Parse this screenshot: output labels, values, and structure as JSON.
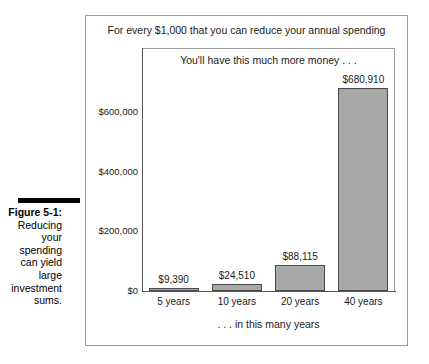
{
  "caption": {
    "figure_label": "Figure 5-1:",
    "text": "Reducing your spending can yield large investment sums."
  },
  "chart_data": {
    "type": "bar",
    "title": "For every $1,000 that you can reduce your annual spending",
    "subtitle": "You'll have this much more money . . .",
    "xlabel": ". . . in this many years",
    "ylabel": "",
    "categories": [
      "5 years",
      "10 years",
      "20 years",
      "40 years"
    ],
    "values": [
      9390,
      24510,
      88115,
      680910
    ],
    "value_labels": [
      "$9,390",
      "$24,510",
      "$88,115",
      "$680,910"
    ],
    "yticks": [
      0,
      200000,
      400000,
      600000
    ],
    "ytick_labels": [
      "$0",
      "$200,000",
      "$400,000",
      "$600,000"
    ],
    "ylim": [
      0,
      815000
    ],
    "grid": false,
    "legend": "none",
    "bar_color": "#a8a8a8",
    "bar_edge_color": "#4a4a4a"
  }
}
